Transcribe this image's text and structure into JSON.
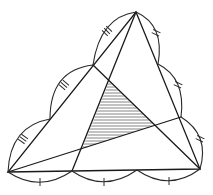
{
  "diagram": {
    "type": "geometry-figure",
    "vertices": {
      "A": [
        8,
        172
      ],
      "B": [
        200,
        169
      ],
      "C": [
        136,
        12
      ]
    },
    "division_points": {
      "bottom": [
        [
          72,
          171
        ],
        [
          137,
          170
        ]
      ],
      "left": [
        [
          50,
          119
        ],
        [
          93,
          65
        ]
      ],
      "right": [
        [
          158,
          64
        ],
        [
          181,
          117
        ]
      ]
    },
    "cevians": [
      {
        "from": "C",
        "to": [
          72,
          171
        ]
      },
      {
        "from": "A",
        "to": [
          181,
          117
        ]
      },
      {
        "from": "B",
        "to": [
          93,
          65
        ]
      }
    ],
    "shaded_triangle": [
      [
        109,
        82
      ],
      [
        154,
        125
      ],
      [
        82,
        149
      ]
    ],
    "tick_marks": {
      "bottom_arcs": "single",
      "right_arcs": "double",
      "left_arcs": "triple"
    },
    "colors": {
      "line": "#1a1a1a",
      "background": "#ffffff"
    }
  }
}
